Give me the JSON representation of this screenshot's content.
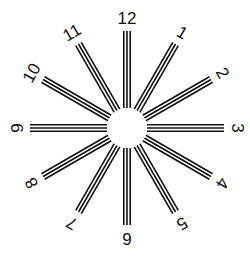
{
  "center": {
    "x": 127,
    "y": 128
  },
  "hub_radius": 20,
  "spoke_inner_radius": 20,
  "spoke_outer_radius": 97,
  "line_spacing": 3.2,
  "lines_per_spoke": 3,
  "label_radius": 110,
  "colors": {
    "line": "#111111",
    "background": "#ffffff",
    "hub": "#ffffff"
  },
  "spokes": [
    {
      "hour": 12,
      "label": "12"
    },
    {
      "hour": 1,
      "label": "1"
    },
    {
      "hour": 2,
      "label": "2"
    },
    {
      "hour": 3,
      "label": "3"
    },
    {
      "hour": 4,
      "label": "4"
    },
    {
      "hour": 5,
      "label": "5"
    },
    {
      "hour": 6,
      "label": "6"
    },
    {
      "hour": 7,
      "label": "7"
    },
    {
      "hour": 8,
      "label": "8"
    },
    {
      "hour": 9,
      "label": "9"
    },
    {
      "hour": 10,
      "label": "10"
    },
    {
      "hour": 11,
      "label": "11"
    }
  ]
}
